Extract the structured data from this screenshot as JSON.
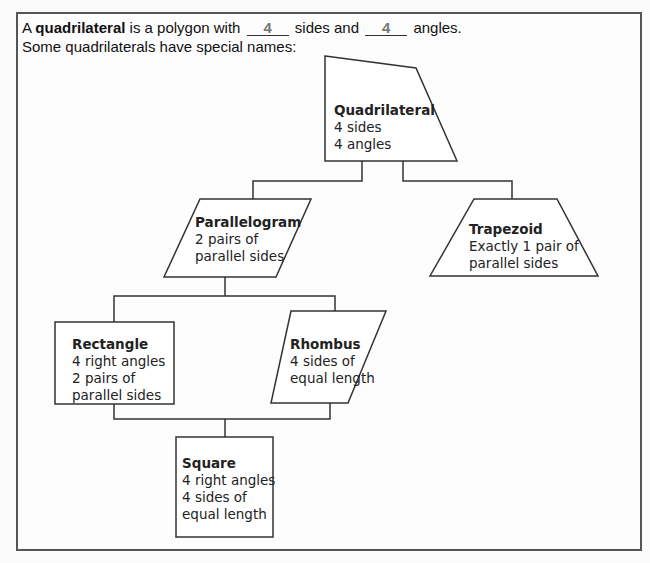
{
  "intro": {
    "line1_prefix": "A",
    "term": "quadrilateral",
    "line1_mid": "is a polygon with",
    "sides_answer": "4",
    "line1_mid2": "sides and",
    "angles_answer": "4",
    "line1_suffix": "angles.",
    "line2": "Some quadrilaterals have special names:"
  },
  "nodes": {
    "quadrilateral": {
      "title": "Quadrilateral",
      "lines": [
        "4 sides",
        "4 angles"
      ]
    },
    "parallelogram": {
      "title": "Parallelogram",
      "lines": [
        "2 pairs of",
        "parallel sides"
      ]
    },
    "trapezoid": {
      "title": "Trapezoid",
      "lines": [
        "Exactly 1 pair of",
        "parallel sides"
      ]
    },
    "rectangle": {
      "title": "Rectangle",
      "lines": [
        "4 right angles",
        "2 pairs of",
        "parallel sides"
      ]
    },
    "rhombus": {
      "title": "Rhombus",
      "lines": [
        "4 sides of",
        "equal length"
      ]
    },
    "square": {
      "title": "Square",
      "lines": [
        "4 right angles",
        "4 sides of",
        "equal length"
      ]
    }
  },
  "colors": {
    "stroke": "#333333",
    "frame": "#555555",
    "answer": "#777777"
  }
}
